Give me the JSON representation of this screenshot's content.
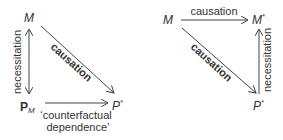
{
  "left_diagram": {
    "node_top": "M",
    "node_bottom_left_base": "P",
    "node_bottom_left_sub": "M",
    "node_bottom_right_base": "P",
    "node_bottom_right_sup": "*",
    "vertical_label": "necessitation",
    "diagonal_label": "causation",
    "horizontal_label_line1": "‘counterfactual",
    "horizontal_label_line2": "dependence’"
  },
  "right_diagram": {
    "node_top_left": "M",
    "node_top_right_base": "M",
    "node_top_right_sup": "*",
    "node_bottom_right_base": "P",
    "node_bottom_right_sup": "*",
    "horizontal_label": "causation",
    "diagonal_label": "causation",
    "vertical_label": "necessitation"
  }
}
